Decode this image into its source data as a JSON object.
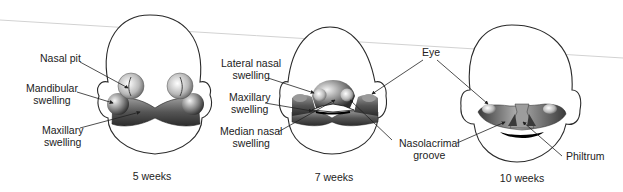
{
  "figure": {
    "panels": [
      {
        "caption": "5 weeks",
        "labels": [
          "Nasal pit",
          "Mandibular swelling",
          "Maxillary swelling"
        ]
      },
      {
        "caption": "7 weeks",
        "labels": [
          "Lateral nasal swelling",
          "Maxillary swelling",
          "Median nasal swelling"
        ]
      },
      {
        "caption": "10 weeks",
        "labels": [
          "Philtrum"
        ]
      }
    ],
    "shared_labels": [
      "Eye",
      "Nasolacrimal groove"
    ]
  },
  "labels": {
    "nasal_pit": "Nasal pit",
    "mandibular_1": "Mandibular",
    "mandibular_2": "swelling",
    "maxillary5_1": "Maxillary",
    "maxillary5_2": "swelling",
    "lateral_1": "Lateral nasal",
    "lateral_2": "swelling",
    "maxillary7_1": "Maxillary",
    "maxillary7_2": "swelling",
    "median_1": "Median nasal",
    "median_2": "swelling",
    "eye": "Eye",
    "naso_1": "Nasolacrimal",
    "naso_2": "groove",
    "philtrum": "Philtrum"
  },
  "captions": {
    "w5": "5 weeks",
    "w7": "7 weeks",
    "w10": "10 weeks"
  },
  "colors": {
    "outline": "#2a2a2a",
    "tissue_dark": "#3a3a3a",
    "tissue_light": "#d8d8d8",
    "guide_line": "#cfcfcf"
  }
}
